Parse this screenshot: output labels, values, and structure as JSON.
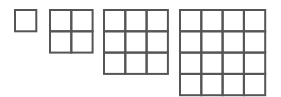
{
  "diagram": {
    "stroke_color": "#555555",
    "background_color": "#ffffff",
    "grids": [
      {
        "name": "grid-1x1",
        "rows": 1,
        "cols": 1
      },
      {
        "name": "grid-2x2",
        "rows": 2,
        "cols": 2
      },
      {
        "name": "grid-3x3",
        "rows": 3,
        "cols": 3
      },
      {
        "name": "grid-4x4",
        "rows": 4,
        "cols": 4
      }
    ]
  }
}
